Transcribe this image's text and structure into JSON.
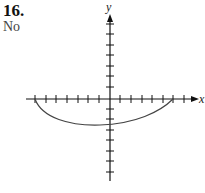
{
  "problem": {
    "number": "16.",
    "answer": "No"
  },
  "graph": {
    "x_label": "x",
    "y_label": "y",
    "x_ticks_left": 7,
    "x_ticks_right": 7,
    "y_ticks_up": 7,
    "y_ticks_down": 7,
    "curve": "Arc below the x-axis from (-7, 0) dipping to about (0, -2.4) and rising to (6, 0)",
    "colors": {
      "axis": "#111111",
      "curve": "#444444"
    }
  }
}
